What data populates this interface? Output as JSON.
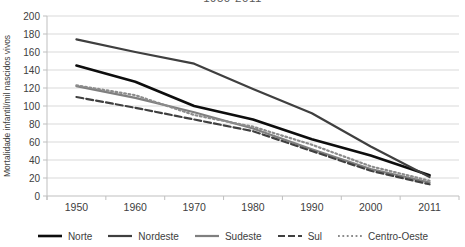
{
  "chart": {
    "title": "1950-2011",
    "ylabel": "Mortalidade infantil/mil nascidos vivos"
  },
  "chart_data": {
    "type": "line",
    "title": "1950-2011",
    "xlabel": "",
    "ylabel": "Mortalidade infantil/mil nascidos vivos",
    "categories": [
      "1950",
      "1960",
      "1970",
      "1980",
      "1990",
      "2000",
      "2011"
    ],
    "ylim": [
      0,
      200
    ],
    "ytick_step": 20,
    "grid": "horizontal",
    "legend_position": "bottom",
    "series": [
      {
        "name": "Norte",
        "values": [
          145,
          127,
          100,
          85,
          63,
          45,
          23
        ],
        "color": "#0d0d0d",
        "style": "solid",
        "width": 2.6
      },
      {
        "name": "Nordeste",
        "values": [
          174,
          160,
          147,
          119,
          92,
          55,
          21
        ],
        "color": "#3f3f3f",
        "style": "solid",
        "width": 2.2
      },
      {
        "name": "Sudeste",
        "values": [
          122,
          109,
          93,
          75,
          52,
          30,
          15
        ],
        "color": "#7f7f7f",
        "style": "solid",
        "width": 2.2
      },
      {
        "name": "Sul",
        "values": [
          110,
          98,
          85,
          72,
          50,
          28,
          13
        ],
        "color": "#404040",
        "style": "dashed",
        "width": 2.2
      },
      {
        "name": "Centro-Oeste",
        "values": [
          123,
          112,
          90,
          77,
          57,
          33,
          17
        ],
        "color": "#8c8c8c",
        "style": "dotted",
        "width": 2.2
      }
    ],
    "colors": {
      "grid": "#d9d9d9",
      "axis": "#bfbfbf",
      "tick_text": "#404040"
    }
  }
}
